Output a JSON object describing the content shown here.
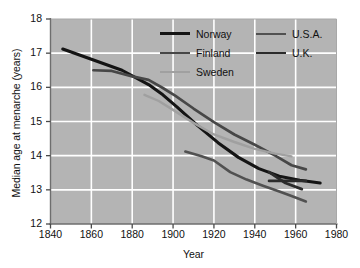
{
  "chart_data": {
    "type": "line",
    "title": "",
    "xlabel": "Year",
    "ylabel": "Median age at menarche (years)",
    "xlim": [
      1840,
      1980
    ],
    "ylim": [
      12,
      18
    ],
    "xticks": [
      1840,
      1860,
      1880,
      1900,
      1920,
      1940,
      1960,
      1980
    ],
    "yticks": [
      12,
      13,
      14,
      15,
      16,
      17,
      18
    ],
    "grid": true,
    "grid_color": "#ffffff",
    "plot_background": "#b4b4b4",
    "legend_position": "top-right-inside",
    "series": [
      {
        "name": "Norway",
        "color": "#141414",
        "width": 3.1,
        "x": [
          1846,
          1860,
          1875,
          1888,
          1895,
          1902,
          1912,
          1922,
          1932,
          1942,
          1952,
          1962,
          1972
        ],
        "y": [
          17.12,
          16.82,
          16.5,
          16.08,
          15.78,
          15.42,
          14.88,
          14.38,
          13.95,
          13.62,
          13.4,
          13.28,
          13.2
        ]
      },
      {
        "name": "Finland",
        "color": "#474747",
        "width": 2.7,
        "x": [
          1861,
          1870,
          1880,
          1888,
          1895,
          1901,
          1910,
          1920,
          1930,
          1940,
          1950,
          1958,
          1965
        ],
        "y": [
          16.5,
          16.48,
          16.32,
          16.22,
          15.98,
          15.76,
          15.38,
          14.98,
          14.62,
          14.32,
          14.0,
          13.72,
          13.6
        ]
      },
      {
        "name": "Sweden",
        "color": "#a0a0a0",
        "width": 2.4,
        "x": [
          1886,
          1893,
          1900,
          1910,
          1920,
          1930,
          1940,
          1950,
          1958
        ],
        "y": [
          15.78,
          15.6,
          15.34,
          14.96,
          14.62,
          14.4,
          14.2,
          14.06,
          13.98
        ]
      },
      {
        "name": "U.S.A.",
        "color": "#515151",
        "width": 2.6,
        "x": [
          1906,
          1914,
          1920,
          1928,
          1936,
          1944,
          1952,
          1958,
          1965
        ],
        "y": [
          14.12,
          13.98,
          13.86,
          13.52,
          13.3,
          13.12,
          12.95,
          12.82,
          12.66
        ]
      },
      {
        "name": "U.K.",
        "color": "#2b2b2b",
        "width": 2.8,
        "segments": [
          {
            "x": [
              1947,
              1958,
              1965
            ],
            "y": [
              13.26,
              13.26,
              13.26
            ]
          },
          {
            "x": [
              1947,
              1955,
              1963
            ],
            "y": [
              13.52,
              13.2,
              13.02
            ]
          }
        ],
        "x": [
          1947,
          1958,
          1965
        ],
        "y": [
          13.26,
          13.26,
          13.26
        ]
      }
    ]
  },
  "legend": {
    "columns": [
      {
        "items": [
          {
            "label": "Norway",
            "color": "#141414",
            "width": 3.2,
            "icon": "line-swatch-icon"
          },
          {
            "label": "Finland",
            "color": "#474747",
            "width": 2.8,
            "icon": "line-swatch-icon"
          },
          {
            "label": "Sweden",
            "color": "#a0a0a0",
            "width": 2.5,
            "icon": "line-swatch-icon"
          }
        ]
      },
      {
        "items": [
          {
            "label": "U.S.A.",
            "color": "#515151",
            "width": 2.8,
            "icon": "line-swatch-icon"
          },
          {
            "label": "U.K.",
            "color": "#2b2b2b",
            "width": 2.9,
            "icon": "line-swatch-icon"
          }
        ]
      }
    ]
  }
}
